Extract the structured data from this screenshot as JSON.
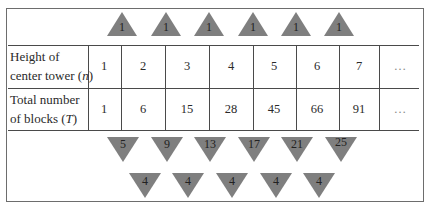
{
  "table": {
    "row_headers": [
      {
        "text": "Height of",
        "text2": "center tower (",
        "var": "n",
        "close": ")"
      },
      {
        "text": "Total number",
        "text2": "of blocks (",
        "var": "T",
        "close": ")"
      }
    ],
    "n_values": [
      "1",
      "2",
      "3",
      "4",
      "5",
      "6",
      "7",
      "…"
    ],
    "t_values": [
      "1",
      "6",
      "15",
      "28",
      "45",
      "66",
      "91",
      "…"
    ]
  },
  "annotations": {
    "second_differences_top": [
      "1",
      "1",
      "1",
      "1",
      "1",
      "1"
    ],
    "first_differences": [
      "5",
      "9",
      "13",
      "17",
      "21",
      "25"
    ],
    "second_differences_bottom": [
      "4",
      "4",
      "4",
      "4",
      "4"
    ]
  },
  "colors": {
    "triangle_fill": "#7f7f7f",
    "grid_line": "#4a4a4a"
  }
}
